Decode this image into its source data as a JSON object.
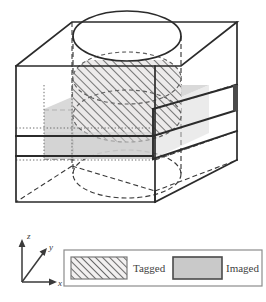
{
  "figure": {
    "title": "",
    "colors": {
      "outline": "#2b2b2b",
      "hidden_line": "#3a3a3a",
      "dotted_line": "#6d6d6d",
      "imaged_fill": "#c9c9c9",
      "imaged_fill_light": "#d6d6d6",
      "tagged_hatch": "#6f6f6f",
      "tagged_fill": "#e8e8e8",
      "legend_border": "#8c8c8c",
      "text": "#3f3f3f",
      "background": "#ffffff"
    }
  },
  "axes": {
    "z_label": "z",
    "y_label": "y",
    "x_label": "x"
  },
  "legend": {
    "entries": [
      {
        "label": "Tagged",
        "swatch": "hatched"
      },
      {
        "label": "Imaged",
        "swatch": "solid-gray"
      }
    ]
  }
}
